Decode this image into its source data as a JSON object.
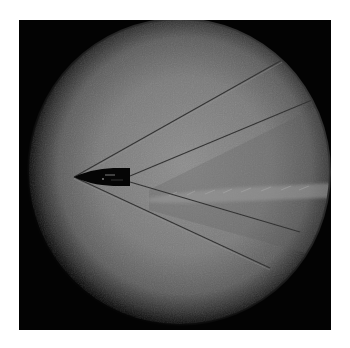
{
  "image": {
    "subject": "Shadowgraph of a bullet in supersonic flight with shock waves",
    "description": "Dark bullet pointing left, with a bow shock from the tip and a tail shock from the base forming V-shaped lines extending right; turbulent wake behind the bullet; circular illuminated field of view on black background"
  },
  "colors": {
    "page_background": "#ffffff",
    "frame_background": "#030303",
    "field_center": "#8a8a8a",
    "field_mid": "#6e6e6e",
    "field_edge": "#2a2a2a",
    "shock_line": "#3a3a3a",
    "bullet": "#050505",
    "wake_highlight": "#a9a9a9"
  },
  "elements": {
    "bullet": {
      "tip": [
        74,
        177
      ],
      "base_x": 130,
      "half_height": 8
    },
    "bow_shock_upper": {
      "from": [
        74,
        177
      ],
      "to": [
        282,
        60
      ]
    },
    "bow_shock_lower": {
      "from": [
        74,
        177
      ],
      "to": [
        270,
        268
      ]
    },
    "tail_shock_upper": {
      "from": [
        130,
        176
      ],
      "to": [
        312,
        100
      ]
    },
    "tail_shock_lower": {
      "from": [
        130,
        182
      ],
      "to": [
        300,
        232
      ]
    }
  }
}
